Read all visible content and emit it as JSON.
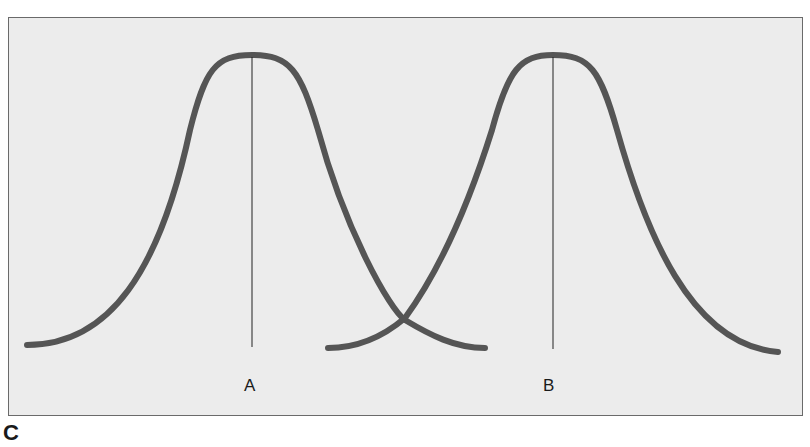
{
  "figure": {
    "panel_label": "C",
    "background": "#ececec",
    "curve_color": "#555555",
    "line_color": "#222222"
  },
  "distributions": [
    {
      "label": "A",
      "mean_x": 252,
      "peak_y": 55,
      "base_y": 345
    },
    {
      "label": "B",
      "mean_x": 553,
      "peak_y": 55,
      "base_y": 348
    }
  ]
}
